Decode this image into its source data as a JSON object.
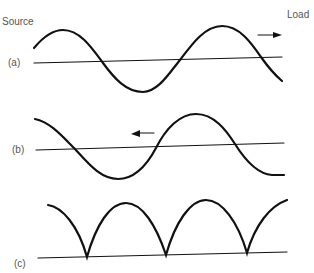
{
  "labels": {
    "source": "Source",
    "load": "Load",
    "panel_a": "(a)",
    "panel_b": "(b)",
    "panel_c": "(c)"
  },
  "colors": {
    "stroke": "#111111",
    "text": "#555555"
  }
}
